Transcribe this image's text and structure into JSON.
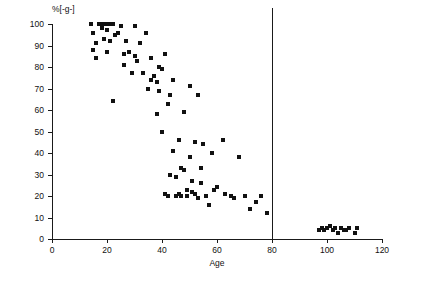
{
  "chart_data": {
    "type": "scatter",
    "title": "",
    "xlabel": "Age",
    "ylabel": "%[-g-]",
    "xlim": [
      0,
      120
    ],
    "ylim": [
      0,
      100
    ],
    "xticks": [
      0,
      20,
      40,
      60,
      80,
      100,
      120
    ],
    "yticks": [
      0,
      10,
      20,
      30,
      40,
      50,
      60,
      70,
      80,
      90,
      100
    ],
    "grid": false,
    "legend": null,
    "annotations": [
      {
        "name": "vertical-reference-line",
        "type": "vline",
        "x": 80
      }
    ],
    "series": [
      {
        "name": "samples",
        "marker": "square",
        "color": "#111111",
        "points": [
          [
            14,
            100
          ],
          [
            15,
            96
          ],
          [
            15,
            88
          ],
          [
            16,
            91
          ],
          [
            16,
            84
          ],
          [
            17,
            100
          ],
          [
            18,
            100
          ],
          [
            18,
            98
          ],
          [
            19,
            100
          ],
          [
            19,
            93
          ],
          [
            20,
            100
          ],
          [
            20,
            97
          ],
          [
            20,
            87
          ],
          [
            21,
            100
          ],
          [
            21,
            92
          ],
          [
            22,
            100
          ],
          [
            22,
            64
          ],
          [
            23,
            95
          ],
          [
            24,
            96
          ],
          [
            25,
            99
          ],
          [
            26,
            86
          ],
          [
            26,
            81
          ],
          [
            27,
            92
          ],
          [
            28,
            87
          ],
          [
            29,
            77
          ],
          [
            30,
            99
          ],
          [
            30,
            85
          ],
          [
            31,
            83
          ],
          [
            32,
            91
          ],
          [
            33,
            77
          ],
          [
            34,
            96
          ],
          [
            35,
            70
          ],
          [
            36,
            84
          ],
          [
            36,
            74
          ],
          [
            37,
            76
          ],
          [
            38,
            73
          ],
          [
            38,
            58
          ],
          [
            39,
            80
          ],
          [
            39,
            69
          ],
          [
            40,
            79
          ],
          [
            40,
            50
          ],
          [
            41,
            86
          ],
          [
            41,
            21
          ],
          [
            42,
            63
          ],
          [
            42,
            20
          ],
          [
            43,
            67
          ],
          [
            43,
            30
          ],
          [
            44,
            74
          ],
          [
            44,
            41
          ],
          [
            45,
            29
          ],
          [
            45,
            20
          ],
          [
            46,
            46
          ],
          [
            46,
            21
          ],
          [
            47,
            33
          ],
          [
            47,
            20
          ],
          [
            48,
            59
          ],
          [
            48,
            32
          ],
          [
            49,
            23
          ],
          [
            49,
            20
          ],
          [
            50,
            71
          ],
          [
            50,
            38
          ],
          [
            51,
            27
          ],
          [
            51,
            22
          ],
          [
            52,
            45
          ],
          [
            52,
            21
          ],
          [
            53,
            67
          ],
          [
            53,
            19
          ],
          [
            54,
            33
          ],
          [
            54,
            26
          ],
          [
            55,
            44
          ],
          [
            56,
            20
          ],
          [
            57,
            16
          ],
          [
            58,
            40
          ],
          [
            59,
            23
          ],
          [
            60,
            24
          ],
          [
            62,
            46
          ],
          [
            63,
            21
          ],
          [
            65,
            20
          ],
          [
            66,
            19
          ],
          [
            68,
            38
          ],
          [
            70,
            20
          ],
          [
            72,
            14
          ],
          [
            74,
            17
          ],
          [
            76,
            20
          ],
          [
            78,
            12
          ],
          [
            97,
            4
          ],
          [
            98,
            5
          ],
          [
            99,
            4
          ],
          [
            100,
            5
          ],
          [
            101,
            6
          ],
          [
            102,
            4
          ],
          [
            103,
            5
          ],
          [
            104,
            3
          ],
          [
            105,
            5
          ],
          [
            106,
            4
          ],
          [
            107,
            4
          ],
          [
            108,
            5
          ],
          [
            110,
            3
          ],
          [
            111,
            5
          ]
        ]
      }
    ]
  }
}
